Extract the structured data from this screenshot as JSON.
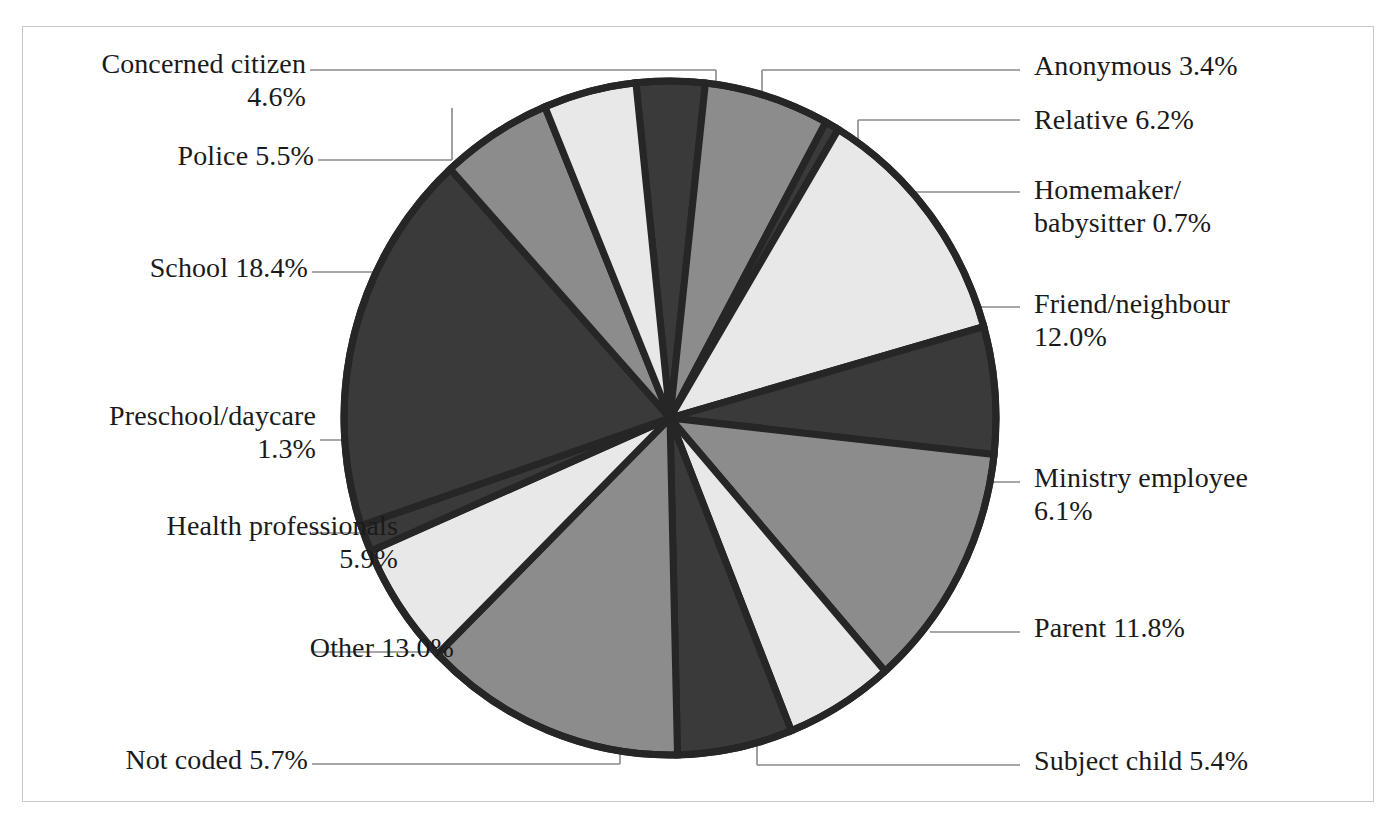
{
  "chart_data": {
    "type": "pie",
    "title": "",
    "subtitle": "",
    "xlabel": "",
    "ylabel": "",
    "grid": false,
    "legend_position": "callout-labels",
    "value_unit": "percent",
    "start_angle_deg": -6,
    "direction": "clockwise",
    "categories": [
      "Anonymous",
      "Relative",
      "Homemaker/\nbabysitter",
      "Friend/neighbour",
      "Ministry employee",
      "Parent",
      "Subject child",
      "Not coded",
      "Other",
      "Health professionals",
      "Preschool/daycare",
      "School",
      "Police",
      "Concerned citizen"
    ],
    "values": [
      3.4,
      6.2,
      0.7,
      12.0,
      6.1,
      11.8,
      5.4,
      5.7,
      13.0,
      5.9,
      1.3,
      18.4,
      5.5,
      4.6
    ],
    "total": 100.0,
    "slice_colors": [
      "#3a3a3a",
      "#8c8c8c",
      "#3a3a3a",
      "#e8e8e8",
      "#3a3a3a",
      "#8c8c8c",
      "#e8e8e8",
      "#3a3a3a",
      "#8c8c8c",
      "#e8e8e8",
      "#3a3a3a",
      "#3a3a3a",
      "#8c8c8c",
      "#e8e8e8"
    ]
  },
  "palette": {
    "dark": "#3a3a3a",
    "mid": "#8c8c8c",
    "light": "#e8e8e8",
    "outline": "#262626",
    "frame": "#c9c9c9",
    "leader": "#8a8a8a",
    "text": "#1a1a1a",
    "background": "#ffffff"
  },
  "labels": {
    "anonymous": "Anonymous 3.4%",
    "relative": "Relative 6.2%",
    "homemaker": "Homemaker/\nbabysitter 0.7%",
    "friend": "Friend/neighbour\n12.0%",
    "ministry": "Ministry employee\n6.1%",
    "parent": "Parent 11.8%",
    "subject_child": "Subject child 5.4%",
    "not_coded": "Not coded 5.7%",
    "other": "Other 13.0%",
    "health": "Health professionals\n5.9%",
    "preschool": "Preschool/daycare\n1.3%",
    "school": "School 18.4%",
    "police": "Police 5.5%",
    "concerned_citizen": "Concerned citizen\n4.6%"
  }
}
